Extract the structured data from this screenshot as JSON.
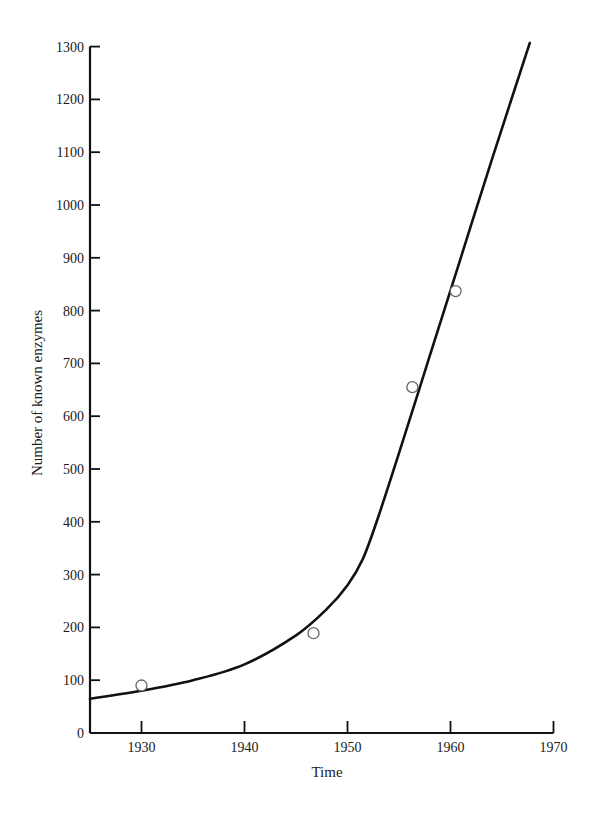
{
  "chart_data": {
    "type": "line",
    "title": "",
    "xlabel": "Time",
    "ylabel": "Number of known enzymes",
    "xlim": [
      1925,
      1970
    ],
    "ylim": [
      0,
      1300
    ],
    "grid": false,
    "legend": null,
    "x_ticks": [
      1930,
      1940,
      1950,
      1960,
      1970
    ],
    "y_ticks": [
      0,
      100,
      200,
      300,
      400,
      500,
      600,
      700,
      800,
      900,
      1000,
      1100,
      1200,
      1300
    ],
    "series": [
      {
        "name": "observed",
        "style": "open-circle markers",
        "x": [
          1930,
          1946.7,
          1956.3,
          1960.5
        ],
        "y": [
          90,
          189,
          655,
          837
        ]
      },
      {
        "name": "fitted curve",
        "style": "solid line",
        "x": [
          1925,
          1930,
          1935,
          1940,
          1945,
          1948,
          1950,
          1951.5,
          1953,
          1955,
          1958,
          1961,
          1964,
          1967.7
        ],
        "y": [
          65,
          80,
          100,
          130,
          185,
          235,
          280,
          330,
          410,
          530,
          715,
          900,
          1085,
          1307
        ]
      }
    ]
  }
}
